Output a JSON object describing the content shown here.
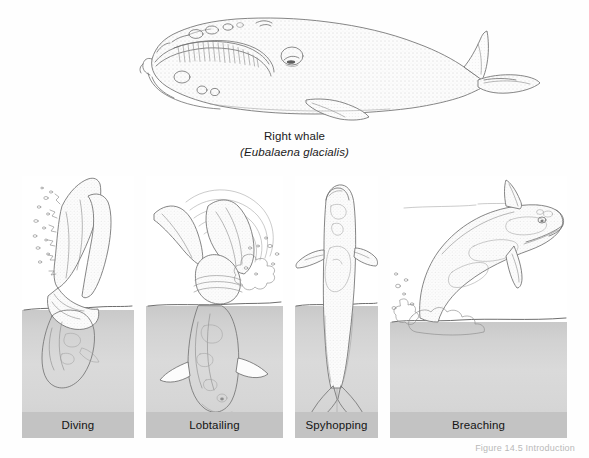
{
  "figure": {
    "species": {
      "common_name": "Right whale",
      "scientific_name": "Eubalaena glacialis",
      "scientific_name_display": "(Eubalaena glacialis)"
    },
    "credit": "Figure 14.5  Introduction",
    "panels": [
      {
        "id": "diving",
        "label": "Diving"
      },
      {
        "id": "lobtailing",
        "label": "Lobtailing"
      },
      {
        "id": "spyhopping",
        "label": "Spyhopping"
      },
      {
        "id": "breaching",
        "label": "Breaching"
      }
    ],
    "colors": {
      "page_background": "#ffffff",
      "panel_water": "#d6d6d6",
      "caption_band": "#c3c3c3",
      "ink": "#6f6f6f",
      "text": "#141414"
    }
  }
}
